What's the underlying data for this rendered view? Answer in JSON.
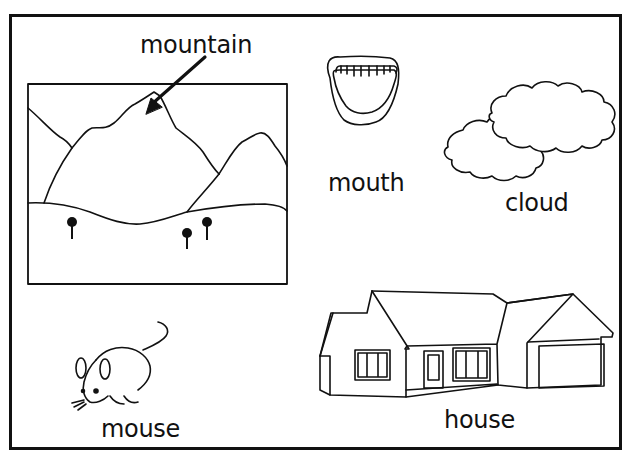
{
  "worksheet": {
    "items": [
      {
        "word": "mountain",
        "picture": "mountain-landscape"
      },
      {
        "word": "mouth",
        "picture": "open-mouth"
      },
      {
        "word": "cloud",
        "picture": "clouds"
      },
      {
        "word": "mouse",
        "picture": "mouse"
      },
      {
        "word": "house",
        "picture": "house"
      }
    ]
  }
}
